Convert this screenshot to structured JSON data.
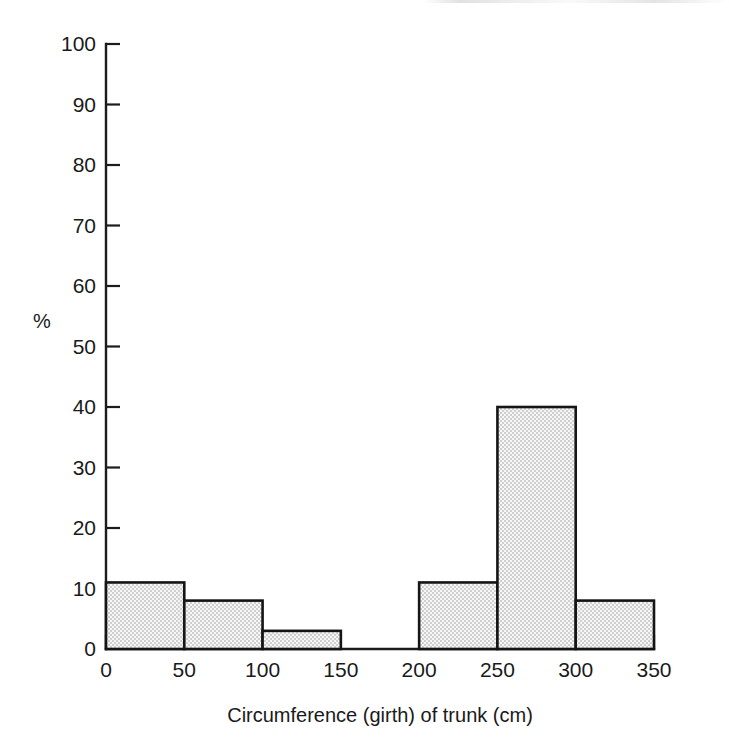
{
  "chart_data": {
    "type": "bar",
    "title": "",
    "subtitle": "",
    "xlabel": "Circumference (girth) of trunk (cm)",
    "ylabel": "%",
    "xlim": [
      0,
      350
    ],
    "ylim": [
      0,
      100
    ],
    "grid": false,
    "legend": false,
    "legend_position": "none",
    "bin_width": 50,
    "x_tick_labels": [
      "0",
      "50",
      "100",
      "150",
      "200",
      "250",
      "300",
      "350"
    ],
    "x_ticks": [
      0,
      50,
      100,
      150,
      200,
      250,
      300,
      350
    ],
    "y_tick_labels": [
      "0",
      "10",
      "20",
      "30",
      "40",
      "50",
      "60",
      "70",
      "80",
      "90",
      "100"
    ],
    "y_ticks": [
      0,
      10,
      20,
      30,
      40,
      50,
      60,
      70,
      80,
      90,
      100
    ],
    "categories": [
      "0-50",
      "50-100",
      "100-150",
      "150-200",
      "200-250",
      "250-300",
      "300-350"
    ],
    "values": [
      11,
      8,
      3,
      0,
      11,
      40,
      8
    ],
    "bins": [
      {
        "start": 0,
        "end": 50,
        "value": 11
      },
      {
        "start": 50,
        "end": 100,
        "value": 8
      },
      {
        "start": 100,
        "end": 150,
        "value": 3
      },
      {
        "start": 150,
        "end": 200,
        "value": 0
      },
      {
        "start": 200,
        "end": 250,
        "value": 11
      },
      {
        "start": 250,
        "end": 300,
        "value": 40
      },
      {
        "start": 300,
        "end": 350,
        "value": 8
      }
    ],
    "colors": {
      "bar_fill": "#e3e3e3",
      "bar_stroke": "#151515",
      "axis": "#1c1c1c",
      "text": "#1a1a1a",
      "background": "#ffffff"
    }
  }
}
